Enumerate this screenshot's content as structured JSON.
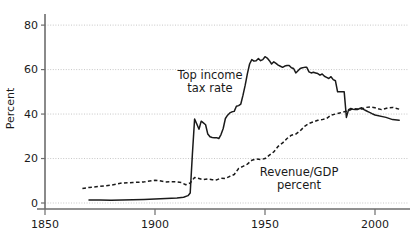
{
  "chart_data": {
    "type": "line",
    "title": "",
    "xlabel": "",
    "ylabel": "Percent",
    "xlim": [
      1850,
      2015
    ],
    "ylim": [
      0,
      85
    ],
    "xticks": [
      1850,
      1900,
      1950,
      2000
    ],
    "xtick_labels": [
      "1850",
      "1900",
      "1950",
      "2000"
    ],
    "yticks": [
      0,
      20,
      40,
      60,
      80
    ],
    "ytick_labels": [
      "0",
      "20",
      "40",
      "60",
      "80"
    ],
    "grid": "horizontal dotted gridlines at each y tick",
    "legend_position": "inline annotations next to curves",
    "annotations": [
      {
        "name": "top-income-tax-rate-label",
        "text_line1": "Top income",
        "text_line2": "tax rate",
        "x": 210,
        "y": 79
      },
      {
        "name": "revenue-gdp-label",
        "text_line1": "Revenue/GDP",
        "text_line2": "percent",
        "x": 299,
        "y": 176
      }
    ],
    "series": [
      {
        "name": "Top income tax rate",
        "style": "solid",
        "color": "#1a1a1a",
        "x": [
          1870,
          1875,
          1880,
          1885,
          1890,
          1895,
          1900,
          1905,
          1910,
          1913,
          1915,
          1916,
          1917,
          1918,
          1919,
          1920,
          1921,
          1922,
          1923,
          1924,
          1925,
          1926,
          1927,
          1928,
          1929,
          1930,
          1931,
          1932,
          1933,
          1934,
          1935,
          1936,
          1937,
          1938,
          1939,
          1940,
          1941,
          1942,
          1943,
          1944,
          1945,
          1946,
          1947,
          1948,
          1949,
          1950,
          1951,
          1952,
          1953,
          1954,
          1955,
          1956,
          1957,
          1958,
          1959,
          1960,
          1961,
          1962,
          1963,
          1964,
          1965,
          1966,
          1967,
          1968,
          1969,
          1970,
          1971,
          1972,
          1973,
          1974,
          1975,
          1976,
          1977,
          1978,
          1979,
          1980,
          1981,
          1982,
          1983,
          1984,
          1985,
          1986,
          1987,
          1988,
          1989,
          1990,
          1991,
          1992,
          1993,
          1994,
          1995,
          1996,
          1997,
          1998,
          1999,
          2000,
          2005,
          2008,
          2011
        ],
        "y": [
          1.4,
          1.3,
          1.2,
          1.3,
          1.5,
          1.6,
          1.8,
          2.0,
          2.3,
          2.6,
          3.3,
          4.5,
          22.0,
          37.8,
          35.5,
          33.2,
          36.8,
          36.0,
          35.2,
          31.0,
          29.8,
          29.5,
          29.4,
          29.4,
          29.0,
          30.8,
          33.5,
          38.0,
          39.5,
          40.5,
          41.0,
          41.2,
          43.5,
          43.8,
          44.5,
          48.5,
          53.0,
          58.2,
          62.5,
          64.5,
          63.8,
          64.0,
          65.0,
          64.0,
          64.5,
          65.8,
          65.2,
          64.0,
          62.5,
          63.5,
          62.8,
          62.0,
          61.5,
          61.0,
          61.6,
          61.8,
          61.8,
          60.8,
          60.5,
          58.5,
          59.5,
          60.5,
          60.8,
          61.0,
          61.0,
          59.0,
          58.5,
          58.8,
          58.5,
          58.2,
          57.5,
          58.0,
          57.0,
          56.5,
          56.0,
          56.8,
          55.5,
          55.0,
          50.0,
          50.0,
          50.0,
          50.0,
          38.5,
          42.0,
          42.5,
          42.2,
          42.0,
          42.0,
          42.5,
          42.8,
          42.0,
          41.5,
          41.0,
          40.5,
          40.0,
          39.6,
          38.5,
          37.5,
          37.2
        ]
      },
      {
        "name": "Revenue/GDP percent",
        "style": "dashed",
        "color": "#1a1a1a",
        "x": [
          1867,
          1870,
          1875,
          1880,
          1885,
          1890,
          1895,
          1900,
          1902,
          1905,
          1908,
          1910,
          1912,
          1914,
          1916,
          1918,
          1920,
          1922,
          1924,
          1926,
          1928,
          1930,
          1932,
          1934,
          1936,
          1938,
          1940,
          1942,
          1944,
          1946,
          1948,
          1950,
          1952,
          1954,
          1956,
          1958,
          1960,
          1962,
          1964,
          1966,
          1968,
          1970,
          1972,
          1974,
          1976,
          1978,
          1980,
          1982,
          1984,
          1986,
          1988,
          1990,
          1992,
          1994,
          1996,
          1998,
          2000,
          2003,
          2006,
          2008,
          2011
        ],
        "y": [
          6.5,
          7.0,
          7.5,
          8.0,
          9.0,
          9.2,
          9.5,
          10.2,
          10.0,
          9.5,
          9.6,
          9.5,
          9.2,
          8.2,
          9.0,
          11.5,
          11.0,
          10.5,
          10.8,
          10.5,
          10.4,
          11.2,
          11.0,
          12.0,
          12.8,
          15.5,
          16.5,
          17.5,
          19.2,
          19.8,
          19.5,
          20.0,
          21.5,
          23.0,
          25.5,
          27.0,
          29.0,
          30.5,
          31.0,
          32.5,
          34.5,
          35.8,
          36.5,
          37.2,
          37.5,
          38.0,
          39.5,
          40.0,
          40.5,
          41.0,
          41.5,
          42.5,
          42.3,
          42.3,
          43.0,
          43.2,
          42.8,
          42.0,
          42.8,
          43.0,
          42.2
        ]
      }
    ]
  }
}
